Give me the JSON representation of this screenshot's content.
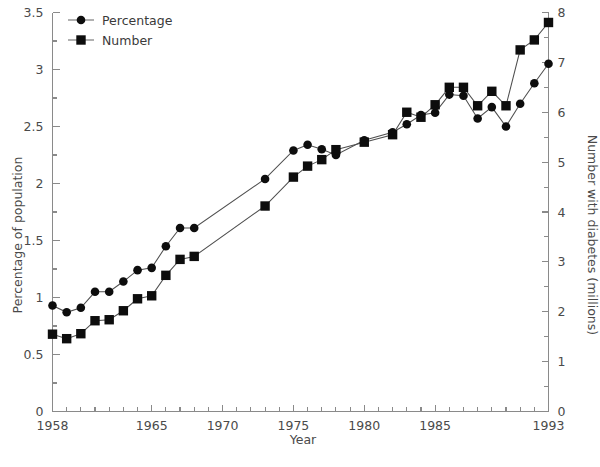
{
  "chart_data": {
    "type": "line",
    "title": "",
    "xlabel": "Year",
    "ylabel": "Percentage of population",
    "y2label": "Number with diabetes (millions)",
    "x": [
      1958,
      1959,
      1960,
      1961,
      1962,
      1963,
      1964,
      1965,
      1966,
      1967,
      1968,
      1973,
      1975,
      1976,
      1977,
      1978,
      1980,
      1982,
      1983,
      1984,
      1985,
      1986,
      1987,
      1988,
      1989,
      1990,
      1991,
      1992,
      1993
    ],
    "xlim": [
      1958,
      1993
    ],
    "ylim": [
      0,
      3.5
    ],
    "y2lim": [
      0,
      8
    ],
    "grid": false,
    "legend_position": "top-left",
    "x_tick_labels": [
      "1958",
      "1965",
      "1970",
      "1975",
      "1980",
      "1985",
      "1993"
    ],
    "x_tick_label_values": [
      1958,
      1965,
      1970,
      1975,
      1980,
      1985,
      1993
    ],
    "x_minor_tick_step": 1,
    "y_tick_labels": [
      "0",
      "0.5",
      "1",
      "1.5",
      "2",
      "2.5",
      "3",
      "3.5"
    ],
    "y_tick_values": [
      0,
      0.5,
      1,
      1.5,
      2,
      2.5,
      3,
      3.5
    ],
    "y_minor_tick_step": 0.25,
    "y2_tick_labels": [
      "0",
      "1",
      "2",
      "3",
      "4",
      "5",
      "6",
      "7",
      "8"
    ],
    "y2_tick_values": [
      0,
      1,
      2,
      3,
      4,
      5,
      6,
      7,
      8
    ],
    "y2_minor_tick_step": 0.5,
    "series": [
      {
        "name": "Percentage",
        "marker": "circle",
        "axis": "left",
        "values": [
          0.93,
          0.87,
          0.91,
          1.05,
          1.05,
          1.14,
          1.24,
          1.26,
          1.45,
          1.61,
          1.61,
          2.04,
          2.29,
          2.34,
          2.3,
          2.25,
          2.38,
          2.45,
          2.52,
          2.6,
          2.62,
          2.78,
          2.77,
          2.57,
          2.67,
          2.5,
          2.7,
          2.88,
          3.05
        ]
      },
      {
        "name": "Number",
        "marker": "square",
        "axis": "right",
        "values": [
          1.55,
          1.46,
          1.56,
          1.82,
          1.84,
          2.02,
          2.26,
          2.32,
          2.73,
          3.05,
          3.11,
          4.12,
          4.7,
          4.92,
          5.05,
          5.25,
          5.4,
          5.55,
          6.0,
          5.9,
          6.15,
          6.5,
          6.5,
          6.13,
          6.42,
          6.13,
          7.25,
          7.45,
          7.8
        ]
      }
    ],
    "legend": [
      "Percentage",
      "Number"
    ],
    "colors": {
      "marker": "#0d0d0d",
      "line": "#4f4f4f",
      "axis": "#8a8a8a",
      "text": "#4a4a4a",
      "background": "#ffffff"
    }
  }
}
